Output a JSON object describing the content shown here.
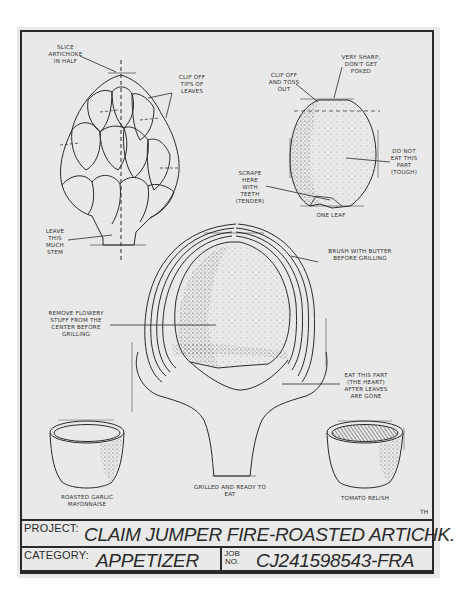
{
  "illustration": {
    "annotations": {
      "slice_half": "Slice\nartichoke\nin half",
      "clip_tips": "Clip off\ntips of\nleaves",
      "leave_stem": "Leave\nthis\nmuch\nstem",
      "clip_toss": "Clip off\nand toss\nout",
      "very_sharp": "Very sharp,\ndon't get\npoked",
      "do_not_eat": "Do not\neat this\npart\n(tough)",
      "scrape_teeth": "Scrape\nhere\nwith\nteeth\n(tender)",
      "one_leaf": "One leaf",
      "brush_butter": "Brush with butter\nbefore grilling",
      "remove_flowery": "Remove flowery\nstuff from the\ncenter before\ngrilling",
      "eat_heart": "Eat this part\n(the heart)\nafter leaves\nare gone",
      "grilled_ready": "Grilled and ready to\neat",
      "garlic_mayo": "Roasted garlic\nmayonnaise",
      "tomato_relish": "Tomato relish"
    },
    "artist_initials": "TH",
    "colors": {
      "paper": "#e9e9e9",
      "ink": "#2a2a2a"
    }
  },
  "title_block": {
    "project_label": "PROJECT:",
    "project_value": "CLAIM JUMPER FIRE-ROASTED ARTICHK.",
    "category_label": "CATEGORY:",
    "category_value": "APPETIZER",
    "job_label_top": "JOB",
    "job_label_bottom": "NO.",
    "job_value": "CJ241598543-FRA"
  }
}
